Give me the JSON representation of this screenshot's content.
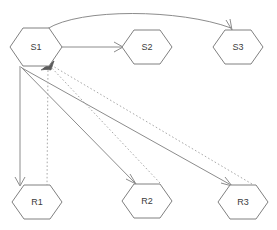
{
  "diagram": {
    "type": "node-link-diagram",
    "canvas": {
      "width": 277,
      "height": 230,
      "background": "#ffffff"
    },
    "style": {
      "node_fill": "#ffffff",
      "node_stroke": "#808080",
      "label_color": "#3c3c3c",
      "solid_edge_color": "#8c8c8c",
      "dotted_edge_color": "#aaaaaa",
      "filled_arrow_color": "#5a5a5a"
    },
    "nodes": [
      {
        "id": "S1",
        "label": "S1",
        "shape": "hexagon",
        "cx": 36,
        "cy": 47,
        "rx": 26,
        "ry": 20
      },
      {
        "id": "S2",
        "label": "S2",
        "shape": "hexagon",
        "cx": 147,
        "cy": 47,
        "rx": 25,
        "ry": 18
      },
      {
        "id": "S3",
        "label": "S3",
        "shape": "hexagon",
        "cx": 238,
        "cy": 47,
        "rx": 25,
        "ry": 18
      },
      {
        "id": "R1",
        "label": "R1",
        "shape": "hexagon",
        "cx": 37,
        "cy": 202,
        "rx": 25,
        "ry": 18
      },
      {
        "id": "R2",
        "label": "R2",
        "shape": "hexagon",
        "cx": 147,
        "cy": 201,
        "rx": 25,
        "ry": 18
      },
      {
        "id": "R3",
        "label": "R3",
        "shape": "hexagon",
        "cx": 243,
        "cy": 202,
        "rx": 25,
        "ry": 18
      }
    ],
    "edges": [
      {
        "id": "e-s1-s3",
        "from": "S1",
        "to": "S3",
        "style": "solid",
        "arrow": "open",
        "shape": "curve"
      },
      {
        "id": "e-s1-s2",
        "from": "S1",
        "to": "S2",
        "style": "solid",
        "arrow": "open",
        "shape": "line"
      },
      {
        "id": "e-s1-r1",
        "from": "S1",
        "to": "R1",
        "style": "solid",
        "arrow": "open",
        "shape": "line"
      },
      {
        "id": "e-s1-r2",
        "from": "S1",
        "to": "R2",
        "style": "solid",
        "arrow": "open",
        "shape": "line"
      },
      {
        "id": "e-s1-r3",
        "from": "S1",
        "to": "R3",
        "style": "solid",
        "arrow": "open",
        "shape": "line"
      },
      {
        "id": "e-r1-s1",
        "from": "R1",
        "to": "S1",
        "style": "dotted",
        "arrow": "filled",
        "shape": "line"
      },
      {
        "id": "e-r2-s1",
        "from": "R2",
        "to": "S1",
        "style": "dotted",
        "arrow": "filled",
        "shape": "line"
      },
      {
        "id": "e-r3-s1",
        "from": "R3",
        "to": "S1",
        "style": "dotted",
        "arrow": "filled",
        "shape": "line"
      }
    ]
  }
}
